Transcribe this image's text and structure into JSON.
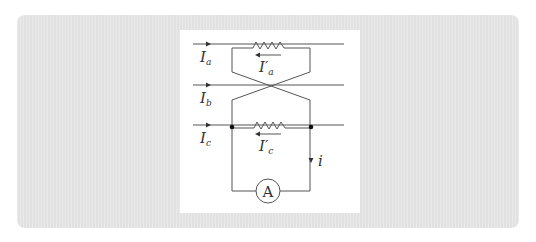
{
  "diagram": {
    "title": "",
    "lines": [
      {
        "id": "a",
        "label_main": "I",
        "label_sub": "a",
        "current_arrow": "right"
      },
      {
        "id": "b",
        "label_main": "I",
        "label_sub": "b",
        "current_arrow": "right"
      },
      {
        "id": "c",
        "label_main": "I",
        "label_sub": "c",
        "current_arrow": "right"
      }
    ],
    "branch_currents": [
      {
        "id": "a_prime",
        "label_main": "I′",
        "label_sub": "a",
        "direction": "left"
      },
      {
        "id": "c_prime",
        "label_main": "I′",
        "label_sub": "c",
        "direction": "left"
      }
    ],
    "loop_current": {
      "label": "i",
      "direction": "down"
    },
    "meter": {
      "symbol": "A",
      "type": "ammeter"
    },
    "colors": {
      "panel_bg": "#e5e5e5",
      "figure_bg": "#ffffff",
      "wire": "#555555",
      "text": "#333333"
    }
  }
}
